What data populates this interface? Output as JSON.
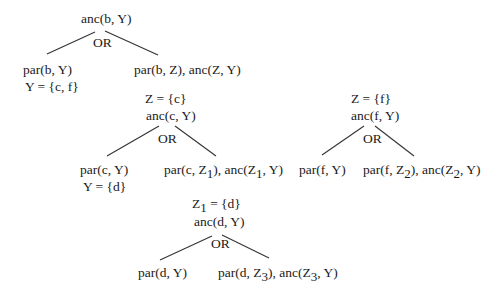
{
  "diagram": {
    "type": "SLD resolution OR-tree",
    "nodes": {
      "root": {
        "goal": "anc(b, Y)",
        "connector": "OR"
      },
      "root_left": {
        "goal": "par(b, Y)",
        "binding": "Y = {c, f}"
      },
      "root_right": {
        "goal": "par(b, Z), anc(Z, Y)"
      },
      "c_branch": {
        "binding": "Z = {c}",
        "goal": "anc(c, Y)",
        "connector": "OR"
      },
      "c_left": {
        "goal": "par(c, Y)",
        "binding": "Y = {d}"
      },
      "c_right": {
        "p1": "par(c, Z",
        "s1": "1",
        "p2": "), anc(Z",
        "s2": "1",
        "p3": ", Y)"
      },
      "d_branch": {
        "b1": "Z",
        "bs": "1",
        "b2": " = {d}",
        "goal": "anc(d, Y)",
        "connector": "OR"
      },
      "d_left": {
        "goal": "par(d, Y)"
      },
      "d_right": {
        "p1": "par(d, Z",
        "s1": "3",
        "p2": "), anc(Z",
        "s2": "3",
        "p3": ", Y)"
      },
      "f_branch": {
        "binding": "Z  = {f}",
        "goal": "anc(f, Y)",
        "connector": "OR"
      },
      "f_left": {
        "goal": "par(f, Y)"
      },
      "f_right": {
        "p1": "par(f, Z",
        "s1": "2",
        "p2": "), anc(Z",
        "s2": "2",
        "p3": ", Y)"
      }
    }
  }
}
